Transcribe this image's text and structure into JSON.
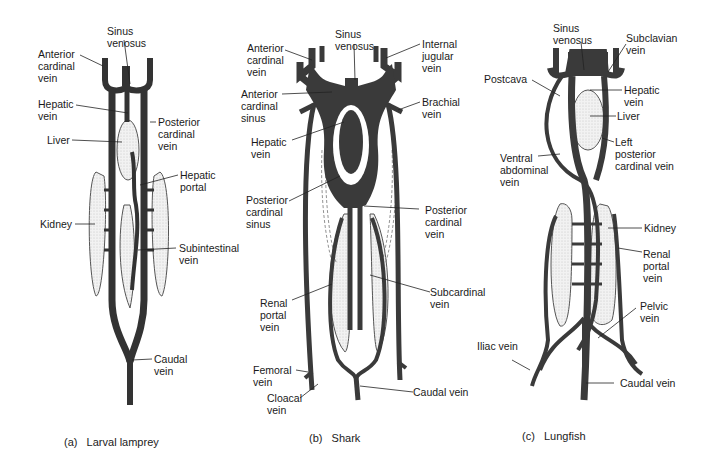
{
  "colors": {
    "vein": "#3a3a3a",
    "organ_fill": "#ececec",
    "organ_stroke": "#555555",
    "leader": "#222222"
  },
  "panels": [
    {
      "id": "a",
      "caption": "(a)   Larval lamprey",
      "labels": {
        "sinus_venosus": "Sinus\nvenosus",
        "anterior_cardinal_vein": "Anterior\ncardinal\nvein",
        "hepatic_vein": "Hepatic\nvein",
        "posterior_cardinal_vein": "Posterior\ncardinal\nvein",
        "liver": "Liver",
        "hepatic_portal": "Hepatic\nportal",
        "kidney": "Kidney",
        "subintestinal_vein": "Subintestinal\nvein",
        "caudal_vein": "Caudal\nvein"
      }
    },
    {
      "id": "b",
      "caption": "(b)   Shark",
      "labels": {
        "sinus_venosus": "Sinus\nvenosus",
        "anterior_cardinal_vein": "Anterior\ncardinal\nvein",
        "internal_jugular_vein": "Internal\njugular\nvein",
        "anterior_cardinal_sinus": "Anterior\ncardinal\nsinus",
        "brachial_vein": "Brachial\nvein",
        "hepatic_vein": "Hepatic\nvein",
        "posterior_cardinal_sinus": "Posterior\ncardinal\nsinus",
        "posterior_cardinal_vein": "Posterior\ncardinal\nvein",
        "renal_portal_vein": "Renal\nportal\nvein",
        "subcardinal_vein": "Subcardinal\nvein",
        "femoral_vein": "Femoral\nvein",
        "cloacal_vein": "Cloacal\nvein",
        "caudal_vein": "Caudal vein"
      }
    },
    {
      "id": "c",
      "caption": "(c)   Lungfish",
      "labels": {
        "sinus_venosus": "Sinus\nvenosus",
        "subclavian_vein": "Subclavian\nvein",
        "postcava": "Postcava",
        "hepatic_vein": "Hepatic\nvein",
        "liver": "Liver",
        "left_posterior_cardinal_vein": "Left\nposterior\ncardinal vein",
        "ventral_abdominal_vein": "Ventral\nabdominal\nvein",
        "kidney": "Kidney",
        "renal_portal_vein": "Renal\nportal\nvein",
        "pelvic_vein": "Pelvic\nvein",
        "iliac_vein": "Iliac vein",
        "caudal_vein": "Caudal vein"
      }
    }
  ]
}
